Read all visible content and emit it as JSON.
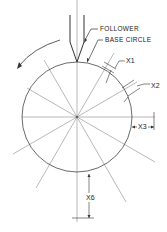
{
  "diagram": {
    "labels": {
      "follower": "FOLLOWER",
      "base_circle": "BASE CIRCLE",
      "x1": "X1",
      "x2": "X2",
      "x3": "X3",
      "x6": "X6"
    },
    "base_circle": {
      "cx": 77,
      "cy": 117,
      "r": 55
    },
    "radial_divisions": 12,
    "division_angle_deg": 30,
    "rotation_direction": "counterclockwise",
    "colors": {
      "stroke": "#333333",
      "thin": "#888888",
      "background": "#ffffff"
    }
  }
}
